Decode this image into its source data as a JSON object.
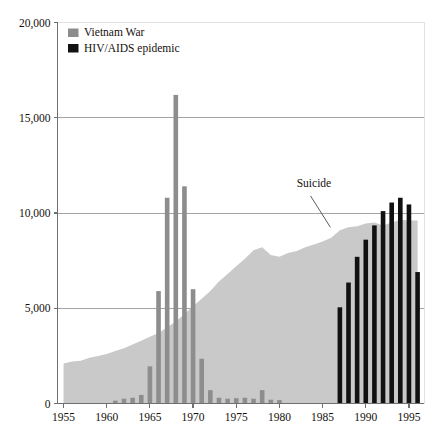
{
  "chart_data": {
    "type": "bar",
    "title": "",
    "subtitle": "",
    "xlabel": "",
    "ylabel": "",
    "xlim": [
      1954.3,
      1996.8
    ],
    "ylim": [
      0,
      20000
    ],
    "grid": true,
    "grid_axis": "y",
    "legend_position": "top-left",
    "y_ticks": [
      0,
      5000,
      10000,
      15000,
      20000
    ],
    "y_tick_labels": [
      "0",
      "5,000",
      "10,000",
      "15,000",
      "20,000"
    ],
    "x_ticks": [
      1955,
      1960,
      1965,
      1970,
      1975,
      1980,
      1985,
      1990,
      1995
    ],
    "x_tick_labels": [
      "1955",
      "1960",
      "1965",
      "1970",
      "1975",
      "1980",
      "1985",
      "1990",
      "1995"
    ],
    "legend": [
      {
        "name": "Vietnam War",
        "color": "#8d8d8d",
        "marker": "square"
      },
      {
        "name": "HIV/AIDS epidemic",
        "color": "#111111",
        "marker": "square"
      }
    ],
    "annotations": [
      {
        "text": "Suicide",
        "text_x": 1984.0,
        "text_y": 11350,
        "leader_from_x": 1983.6,
        "leader_from_y": 10900,
        "leader_to_x": 1985.9,
        "leader_to_y": 9250
      }
    ],
    "series": [
      {
        "name": "Suicide",
        "type": "area",
        "color": "#c9c9c9",
        "x": [
          1955,
          1956,
          1957,
          1958,
          1959,
          1960,
          1961,
          1962,
          1963,
          1964,
          1965,
          1966,
          1967,
          1968,
          1969,
          1970,
          1971,
          1972,
          1973,
          1974,
          1975,
          1976,
          1977,
          1978,
          1979,
          1980,
          1981,
          1982,
          1983,
          1984,
          1985,
          1986,
          1987,
          1988,
          1989,
          1990,
          1991,
          1992,
          1993,
          1994,
          1995,
          1996
        ],
        "values": [
          2100,
          2200,
          2250,
          2400,
          2500,
          2600,
          2750,
          2900,
          3100,
          3300,
          3500,
          3700,
          4000,
          4300,
          4700,
          5100,
          5500,
          5900,
          6400,
          6800,
          7200,
          7600,
          8050,
          8200,
          7800,
          7700,
          7900,
          8000,
          8200,
          8350,
          8500,
          8700,
          9100,
          9250,
          9300,
          9450,
          9500,
          9350,
          9500,
          9650,
          9600,
          9600
        ]
      },
      {
        "name": "Vietnam War",
        "type": "bar",
        "color": "#8d8d8d",
        "x": [
          1961,
          1962,
          1963,
          1964,
          1965,
          1966,
          1967,
          1968,
          1969,
          1970,
          1971,
          1972,
          1973,
          1974,
          1975,
          1976,
          1977,
          1978,
          1979,
          1980
        ],
        "values": [
          150,
          250,
          300,
          450,
          1950,
          5900,
          10800,
          16200,
          11400,
          6000,
          2350,
          700,
          300,
          250,
          280,
          300,
          250,
          700,
          200,
          180
        ]
      },
      {
        "name": "HIV/AIDS epidemic",
        "type": "bar",
        "color": "#111111",
        "x": [
          1987,
          1988,
          1989,
          1990,
          1991,
          1992,
          1993,
          1994,
          1995,
          1996
        ],
        "values": [
          5050,
          6350,
          7700,
          8600,
          9350,
          10100,
          10550,
          10800,
          10450,
          6900
        ]
      }
    ]
  },
  "accent_colors": {
    "vietnam": "#8d8d8d",
    "hiv": "#111111",
    "suicide_area": "#c9c9c9",
    "axis": "#6f6f6f",
    "gridline": "#9a9a9a",
    "text": "#15100c",
    "background": "#ffffff"
  }
}
